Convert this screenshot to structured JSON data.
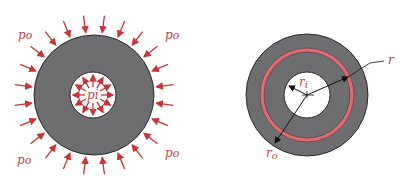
{
  "colors": {
    "cylinder_fill": "#6e6e70",
    "cylinder_stroke": "#2a2a2a",
    "arrow": "#c8343a",
    "label": "#c0464c",
    "ring": "#e06b72",
    "dimension_line": "#111111",
    "bore": "#ffffff"
  },
  "left_figure": {
    "title": "thick-walled cylinder under pressure",
    "outer_pressure_labels": [
      "p_o",
      "p_o",
      "p_o",
      "p_o"
    ],
    "outer_label_text": "po",
    "inner_pressure_label": "pi",
    "outer_arrow_count": 24,
    "inner_arrow_count": 12
  },
  "right_figure": {
    "title": "radii definition",
    "labels": {
      "inner_radius": "ri",
      "outer_radius": "ro",
      "radius": "r"
    }
  }
}
